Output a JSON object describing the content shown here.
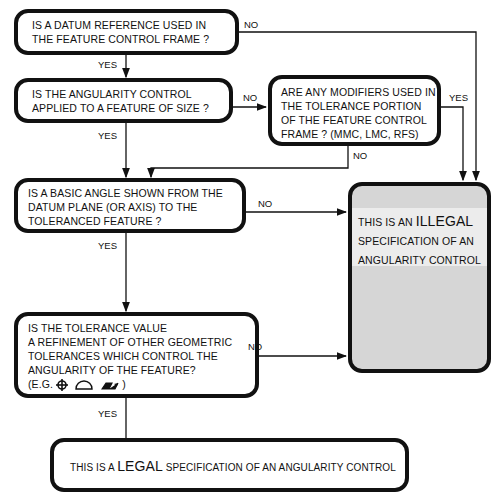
{
  "nodes": {
    "q1": {
      "lines": [
        "IS A DATUM REFERENCE USED IN",
        "THE FEATURE CONTROL FRAME ?"
      ]
    },
    "q2": {
      "lines": [
        "IS THE  ANGULARITY  CONTROL",
        "APPLIED TO A FEATURE OF SIZE ?"
      ]
    },
    "q3": {
      "lines": [
        "ARE ANY MODIFIERS USED IN",
        "THE  TOLERANCE PORTION",
        "OF THE FEATURE CONTROL",
        "FRAME ? (MMC, LMC, RFS)"
      ]
    },
    "q4": {
      "lines": [
        "IS A BASIC ANGLE SHOWN FROM THE",
        "DATUM PLANE (OR AXIS) TO THE",
        "TOLERANCED FEATURE  ?"
      ]
    },
    "q5": {
      "lines": [
        "IS THE TOLERANCE VALUE",
        "A  REFINEMENT OF OTHER GEOMETRIC",
        "TOLERANCES WHICH CONTROL THE",
        "ANGULARITY OF THE FEATURE?"
      ],
      "example_prefix": "(E.G.",
      "example_suffix": ")",
      "example_icons": [
        "position-icon",
        "profile-of-surface-icon",
        "total-runout-icon"
      ]
    },
    "illegal": {
      "prefix": "THIS IS AN",
      "emphasis": "ILLEGAL",
      "line2": "SPECIFICATION  OF AN",
      "line3": "ANGULARITY  CONTROL"
    },
    "legal": {
      "prefix": "THIS IS A",
      "emphasis": "LEGAL",
      "suffix": "SPECIFICATION OF AN ANGULARITY CONTROL"
    }
  },
  "edges": {
    "q1_yes": "YES",
    "q1_no": "NO",
    "q2_yes": "YES",
    "q2_no": "NO",
    "q3_yes": "YES",
    "q3_no": "NO",
    "q4_yes": "YES",
    "q4_no": "NO",
    "q5_yes": "YES",
    "q5_no": "NO"
  },
  "colors": {
    "stroke": "#111111",
    "illegal_fill": "#d6d6d6",
    "background": "#ffffff"
  }
}
